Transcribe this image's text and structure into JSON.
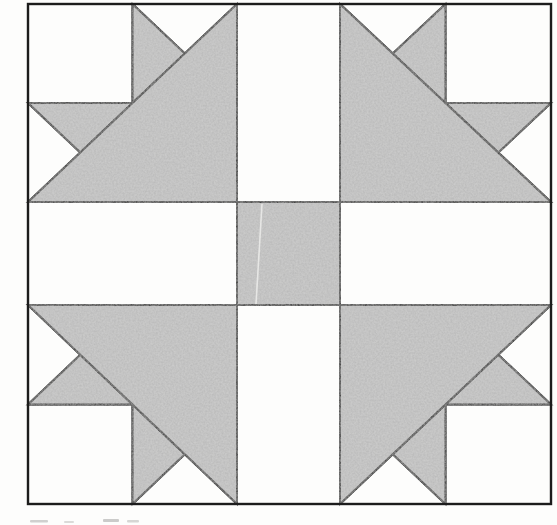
{
  "figure": {
    "type": "quilt_block_diagram",
    "canvas": {
      "width": 557,
      "height": 525
    },
    "colors": {
      "background": "#fdfdfc",
      "shaded_patch": "#b8b8b8",
      "shaded_speckle": "#d6d6d4",
      "light_patch": "#fdfdfc",
      "seam_line": "#242424",
      "border_line": "#1c1c1c",
      "scratch": "#ededeb",
      "caption_ink": "#9a9a98"
    },
    "grid": {
      "cols": [
        28,
        131,
        237,
        340,
        447,
        551
      ],
      "rows": [
        4,
        102,
        202,
        305,
        403,
        504
      ]
    },
    "seam": {
      "stroke_width": 2
    },
    "border": {
      "stroke_width": 2.4
    },
    "unit_shapes": [
      {
        "name": "corner-square",
        "tone": "light",
        "points": [
          [
            0,
            0
          ],
          [
            0.5,
            0
          ],
          [
            0.5,
            0.5
          ],
          [
            0,
            0.5
          ]
        ]
      },
      {
        "name": "top-notch",
        "tone": "light",
        "points": [
          [
            0.5,
            0
          ],
          [
            1,
            0
          ],
          [
            0.75,
            0.25
          ]
        ]
      },
      {
        "name": "side-notch",
        "tone": "light",
        "points": [
          [
            0,
            0.5
          ],
          [
            0.25,
            0.75
          ],
          [
            0,
            1
          ]
        ]
      },
      {
        "name": "top-star-point",
        "tone": "shaded",
        "points": [
          [
            0.5,
            0
          ],
          [
            0.75,
            0.25
          ],
          [
            0.5,
            0.5
          ]
        ]
      },
      {
        "name": "side-star-point",
        "tone": "shaded",
        "points": [
          [
            0,
            0.5
          ],
          [
            0.5,
            0.5
          ],
          [
            0.25,
            0.75
          ]
        ]
      },
      {
        "name": "large-triangle",
        "tone": "shaded",
        "points": [
          [
            1,
            0
          ],
          [
            1,
            1
          ],
          [
            0,
            1
          ]
        ]
      }
    ],
    "units": [
      {
        "name": "top-left-unit",
        "col": 0,
        "row": 0,
        "flip_x": false,
        "flip_y": false
      },
      {
        "name": "top-right-unit",
        "col": 3,
        "row": 0,
        "flip_x": true,
        "flip_y": false
      },
      {
        "name": "bottom-left-unit",
        "col": 0,
        "row": 3,
        "flip_x": false,
        "flip_y": true
      },
      {
        "name": "bottom-right-unit",
        "col": 3,
        "row": 3,
        "flip_x": true,
        "flip_y": true
      }
    ],
    "center_square": {
      "col": 2,
      "row": 2,
      "tone": "shaded"
    },
    "print_scratch": {
      "x1": 262,
      "y1": 204,
      "x2": 256,
      "y2": 304
    },
    "caption_marks": [
      {
        "x": 30,
        "y": 520,
        "w": 18,
        "h": 2.5,
        "opacity": 0.45
      },
      {
        "x": 64,
        "y": 521,
        "w": 10,
        "h": 2.0,
        "opacity": 0.35
      },
      {
        "x": 103,
        "y": 519,
        "w": 16,
        "h": 3.0,
        "opacity": 0.5
      },
      {
        "x": 127,
        "y": 520,
        "w": 12,
        "h": 2.5,
        "opacity": 0.4
      }
    ]
  }
}
